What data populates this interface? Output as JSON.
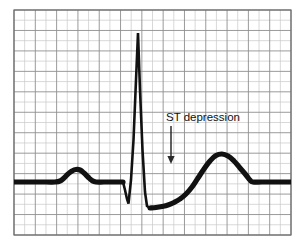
{
  "figure": {
    "background_color": "#ffffff",
    "trace_color": "#111111",
    "grid_minor_color": "#c9c9c9",
    "grid_major_color": "#8e8e8e",
    "grid_frame_color": "#6b6b6b"
  },
  "grid": {
    "left": 14,
    "top": 10,
    "right": 291,
    "bottom": 235,
    "columns": 13,
    "rows": 11,
    "cell_width": 21.3,
    "cell_height": 20.45,
    "major_every": 1
  },
  "annotation": {
    "label": "ST depression",
    "text_x": 166,
    "text_y": 121,
    "arrow_x": 171,
    "arrow_top_y": 126,
    "arrow_bottom_y": 164,
    "arrow_color": "#2b2b2b"
  },
  "chart_data": {
    "type": "line",
    "xlabel": "",
    "ylabel": "",
    "xlim": [
      14,
      291
    ],
    "ylim": [
      235,
      10
    ],
    "grid": true,
    "legend": null,
    "baseline_y": 182,
    "annotations": [
      {
        "text": "ST depression",
        "points_to_x": 171,
        "points_to_y": 164,
        "label_x": 166,
        "label_y": 121
      }
    ],
    "features": [
      {
        "name": "baseline-start",
        "x": 14,
        "y": 182
      },
      {
        "name": "p-wave-onset",
        "x": 58,
        "y": 182
      },
      {
        "name": "p-wave-peak",
        "x": 76,
        "y": 169
      },
      {
        "name": "p-wave-offset",
        "x": 95,
        "y": 182
      },
      {
        "name": "pr-segment",
        "x": 122,
        "y": 182
      },
      {
        "name": "q-wave-trough",
        "x": 128,
        "y": 203
      },
      {
        "name": "r-wave-peak",
        "x": 138,
        "y": 33
      },
      {
        "name": "s-wave-trough",
        "x": 148,
        "y": 208
      },
      {
        "name": "st-segment-depressed",
        "x": 170,
        "y": 205
      },
      {
        "name": "t-wave-peak",
        "x": 218,
        "y": 154
      },
      {
        "name": "t-wave-offset",
        "x": 252,
        "y": 182
      },
      {
        "name": "baseline-end",
        "x": 291,
        "y": 182
      }
    ],
    "series": [
      {
        "name": "ECG lead tracing",
        "points": [
          [
            14,
            182
          ],
          [
            30,
            182
          ],
          [
            46,
            182
          ],
          [
            55,
            182
          ],
          [
            60,
            181
          ],
          [
            64,
            178
          ],
          [
            68,
            174
          ],
          [
            72,
            171
          ],
          [
            76,
            169.5
          ],
          [
            80,
            170
          ],
          [
            84,
            173
          ],
          [
            88,
            177
          ],
          [
            92,
            180.5
          ],
          [
            96,
            182
          ],
          [
            104,
            182
          ],
          [
            112,
            182
          ],
          [
            120,
            182
          ],
          [
            123,
            182
          ],
          [
            125,
            190
          ],
          [
            127,
            199
          ],
          [
            128.5,
            203.5
          ],
          [
            131,
            180
          ],
          [
            133.5,
            140
          ],
          [
            136,
            80
          ],
          [
            138,
            33
          ],
          [
            140,
            90
          ],
          [
            142.5,
            150
          ],
          [
            145,
            192
          ],
          [
            147,
            206
          ],
          [
            150,
            208
          ],
          [
            156,
            207.5
          ],
          [
            162,
            206.5
          ],
          [
            168,
            205
          ],
          [
            174,
            202.5
          ],
          [
            180,
            199
          ],
          [
            186,
            194
          ],
          [
            192,
            187
          ],
          [
            198,
            178
          ],
          [
            204,
            169
          ],
          [
            210,
            161
          ],
          [
            216,
            155.5
          ],
          [
            222,
            154
          ],
          [
            228,
            156
          ],
          [
            234,
            161
          ],
          [
            240,
            168
          ],
          [
            246,
            175
          ],
          [
            250,
            180
          ],
          [
            253,
            182
          ],
          [
            262,
            182
          ],
          [
            274,
            182
          ],
          [
            291,
            182
          ]
        ]
      }
    ]
  }
}
